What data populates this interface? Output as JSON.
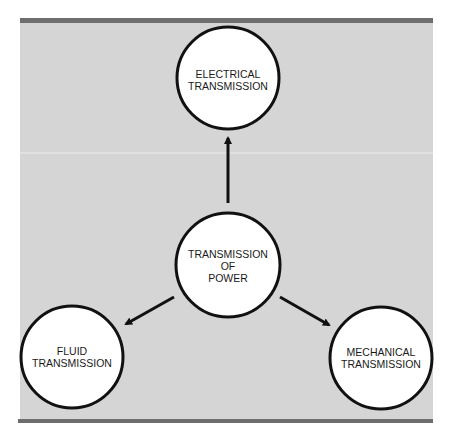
{
  "diagram": {
    "colors": {
      "panel": "#d5d5d5",
      "bar": "#6e6e6e",
      "circle_fill": "#ffffff",
      "stroke": "#111111"
    },
    "center": {
      "lines": [
        "TRANSMISSION",
        "OF",
        "POWER"
      ]
    },
    "top": {
      "lines": [
        "ELECTRICAL",
        "TRANSMISSION"
      ]
    },
    "left": {
      "lines": [
        "FLUID",
        "TRANSMISSION"
      ]
    },
    "right": {
      "lines": [
        "MECHANICAL",
        "TRANSMISSION"
      ]
    }
  }
}
